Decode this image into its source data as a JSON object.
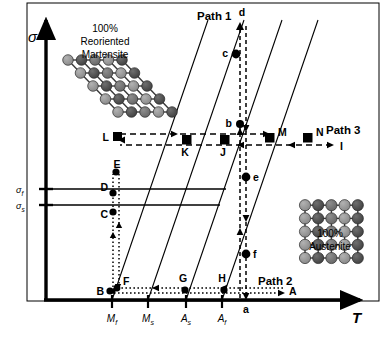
{
  "figure": {
    "type": "phase-diagram",
    "axes": {
      "y_label": "σ",
      "x_label": "T",
      "y_ticks": [
        {
          "id": "sigma_f",
          "label": "σ",
          "sub": "f",
          "y": 189
        },
        {
          "id": "sigma_s",
          "label": "σ",
          "sub": "s",
          "y": 205
        }
      ],
      "x_ticks": [
        {
          "id": "Mf",
          "label": "M",
          "sub": "f",
          "x": 112
        },
        {
          "id": "Ms",
          "label": "M",
          "sub": "s",
          "x": 148
        },
        {
          "id": "As",
          "label": "A",
          "sub": "s",
          "x": 186
        },
        {
          "id": "Af",
          "label": "A",
          "sub": "f",
          "x": 222
        }
      ]
    },
    "paths": [
      {
        "name": "Path 1",
        "x": 228,
        "y": 16
      },
      {
        "name": "Path 2",
        "x": 288,
        "y": 281
      },
      {
        "name": "Path 3",
        "x": 345,
        "y": 133
      }
    ],
    "lattices": [
      {
        "id": "martensite",
        "line1": "100%",
        "line2": "Reoriented",
        "line3": "Martensite",
        "title_x": 105,
        "title_y": 30,
        "sheared": true,
        "rows": 5,
        "cols": 5
      },
      {
        "id": "austenite",
        "line1": "100%",
        "line2": "Austenite",
        "title_x": 330,
        "title_y": 236,
        "sheared": false,
        "rows": 5,
        "cols": 5
      }
    ],
    "points": [
      {
        "id": "A",
        "label": "A",
        "x": 286,
        "y": 291,
        "marker": "none",
        "lx": 288,
        "ly": 288,
        "anchor": "start"
      },
      {
        "id": "B",
        "label": "B",
        "x": 110,
        "y": 291,
        "marker": "circle",
        "lx": 104,
        "ly": 294,
        "anchor": "end"
      },
      {
        "id": "C",
        "label": "C",
        "x": 113,
        "y": 212,
        "marker": "circle",
        "lx": 108,
        "ly": 216,
        "anchor": "end"
      },
      {
        "id": "D",
        "label": "D",
        "x": 113,
        "y": 193,
        "marker": "circle",
        "lx": 108,
        "ly": 190,
        "anchor": "end"
      },
      {
        "id": "E",
        "label": "E",
        "x": 116,
        "y": 172,
        "marker": "circle",
        "lx": 116,
        "ly": 166,
        "anchor": "middle"
      },
      {
        "id": "F",
        "label": "F",
        "x": 117,
        "y": 288,
        "marker": "circle",
        "lx": 122,
        "ly": 284,
        "anchor": "start"
      },
      {
        "id": "G",
        "label": "G",
        "x": 185,
        "y": 289,
        "marker": "circle",
        "lx": 183,
        "ly": 282,
        "anchor": "middle"
      },
      {
        "id": "H",
        "label": "H",
        "x": 224,
        "y": 289,
        "marker": "circle",
        "lx": 222,
        "ly": 282,
        "anchor": "middle"
      },
      {
        "id": "I",
        "label": "I",
        "x": 335,
        "y": 147,
        "marker": "none",
        "lx": 340,
        "ly": 150,
        "anchor": "start"
      },
      {
        "id": "J",
        "label": "J",
        "x": 225,
        "y": 141,
        "marker": "square",
        "lx": 222,
        "ly": 153,
        "anchor": "middle"
      },
      {
        "id": "K",
        "label": "K",
        "x": 187,
        "y": 141,
        "marker": "square",
        "lx": 184,
        "ly": 153,
        "anchor": "middle"
      },
      {
        "id": "L",
        "label": "L",
        "x": 117,
        "y": 137,
        "marker": "square",
        "lx": 110,
        "ly": 141,
        "anchor": "end"
      },
      {
        "id": "M",
        "label": "M",
        "x": 270,
        "y": 137,
        "marker": "square",
        "lx": 277,
        "ly": 136,
        "anchor": "start"
      },
      {
        "id": "N",
        "label": "N",
        "x": 308,
        "y": 137,
        "marker": "square",
        "lx": 314,
        "ly": 136,
        "anchor": "start"
      },
      {
        "id": "a",
        "label": "a",
        "x": 246,
        "y": 300,
        "marker": "none",
        "lx": 246,
        "ly": 311,
        "anchor": "middle"
      },
      {
        "id": "b",
        "label": "b",
        "x": 240,
        "y": 124,
        "marker": "circle",
        "lx": 233,
        "ly": 125,
        "anchor": "end"
      },
      {
        "id": "c",
        "label": "c",
        "x": 236,
        "y": 54,
        "marker": "circle",
        "lx": 229,
        "ly": 56,
        "anchor": "end"
      },
      {
        "id": "d",
        "label": "d",
        "x": 240,
        "y": 22,
        "marker": "none",
        "lx": 241,
        "ly": 15,
        "anchor": "middle"
      },
      {
        "id": "e",
        "label": "e",
        "x": 246,
        "y": 177,
        "marker": "circle",
        "lx": 253,
        "ly": 180,
        "anchor": "start"
      },
      {
        "id": "f",
        "label": "f",
        "x": 246,
        "y": 254,
        "marker": "circle",
        "lx": 253,
        "ly": 257,
        "anchor": "start"
      }
    ],
    "colors": {
      "stroke": "#000000",
      "lattice_dark": "#4d4d4d",
      "lattice_mid": "#777777",
      "lattice_light": "#9a9a9a",
      "background": "#ffffff"
    }
  }
}
